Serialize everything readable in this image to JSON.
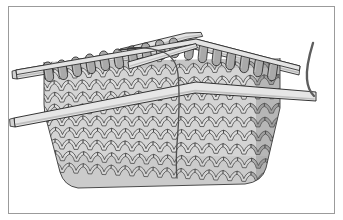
{
  "figure": {
    "kind": "illustration",
    "alt_text": "Grayscale line drawing of a knitted swatch in stockinette stitch held on a pair of straight knitting needles, with a dark working yarn running down the centre and a yarn tail curving off at the right",
    "has_text": "false",
    "background_color": "#ffffff"
  },
  "frame": {
    "label": "illustration-border",
    "stroke_color": "#9b9b9b",
    "stroke_width": "1",
    "inset_x": "8",
    "inset_y": "6",
    "width": "327",
    "height": "208",
    "fill": "#ffffff"
  },
  "palette": {
    "outline": "#1c1c1c",
    "yarn_light": "#dcdcdc",
    "yarn_mid": "#c4c4c4",
    "yarn_shadow": "#a8a8a8",
    "yarn_dark": "#8d8d8d",
    "needle_fill": "#e2e2e2",
    "needle_shadow": "#bdbdbd",
    "working_yarn": "#555555",
    "fabric_edge": "#9a9a9a"
  },
  "elements": {
    "fabric": {
      "label": "knitted-fabric-swatch",
      "stitch_pattern": "stockinette",
      "stitch_columns": "17",
      "stitch_rows": "9",
      "fill": "#d2d2d2"
    },
    "back_needle": {
      "label": "back-knitting-needle",
      "description": "upper needle holding the live stitches, angled slightly upward to the right",
      "fill": "#e2e2e2"
    },
    "front_needle": {
      "label": "front-knitting-needle",
      "description": "lower working needle passing in front of the fabric",
      "fill": "#e2e2e2"
    },
    "needle_tip_upper": {
      "label": "upper-needle-tip",
      "description": "tapered point of the back needle crossing near the top centre"
    },
    "needle_tip_lower": {
      "label": "lower-needle-tip",
      "description": "tapered point of the front needle crossing near the top centre"
    },
    "live_stitches": {
      "label": "live-stitch-loops",
      "count": "17",
      "fill": "#a8a8a8",
      "description": "dark loops seated over the needle shaft along the top edge"
    },
    "working_yarn": {
      "label": "working-yarn-strand",
      "description": "thin dark strand running vertically down the centre of the fabric",
      "stroke": "#555555"
    },
    "yarn_tail": {
      "label": "yarn-tail",
      "description": "dark strand curving up and off at the right edge",
      "stroke": "#6a6a6a"
    }
  }
}
